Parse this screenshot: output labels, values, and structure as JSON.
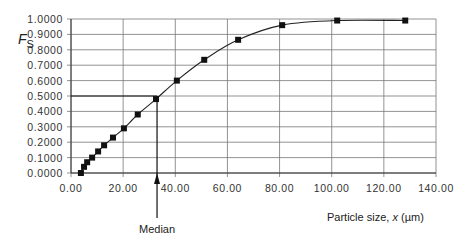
{
  "chart_data": {
    "type": "line",
    "title": "",
    "xlabel": "Particle size, x (µm)",
    "xlabel_parts": {
      "prefix": "Particle size, ",
      "var": "x",
      "unit": " (µm)"
    },
    "ylabel": "F_S",
    "ylabel_parts": {
      "main": "F",
      "sub": "S"
    },
    "xlim": [
      0,
      140
    ],
    "ylim": [
      0,
      1
    ],
    "grid": true,
    "legend": null,
    "x_ticks": [
      "0.00",
      "20.00",
      "40.00",
      "60.00",
      "80.00",
      "100.00",
      "120.00",
      "140.00"
    ],
    "y_ticks": [
      "0.0000",
      "0.1000",
      "0.2000",
      "0.3000",
      "0.4000",
      "0.5000",
      "0.6000",
      "0.7000",
      "0.8000",
      "0.9000",
      "1.0000"
    ],
    "series": [
      {
        "name": "Cumulative fraction undersize",
        "marker": "square",
        "x": [
          3.8,
          5.0,
          6.2,
          8.1,
          10.4,
          12.7,
          16.1,
          20.3,
          25.6,
          32.6,
          40.6,
          51.1,
          64.1,
          81.0,
          102.1,
          128.2
        ],
        "y": [
          0.0,
          0.04,
          0.07,
          0.1,
          0.14,
          0.18,
          0.23,
          0.29,
          0.38,
          0.48,
          0.6,
          0.735,
          0.865,
          0.96,
          0.99,
          0.99
        ]
      }
    ],
    "annotations": [
      {
        "text": "Median",
        "x": 33.0,
        "y": 0.5,
        "type": "arrow-up-from-label"
      }
    ],
    "median_x": 33.0,
    "median_y": 0.5
  }
}
